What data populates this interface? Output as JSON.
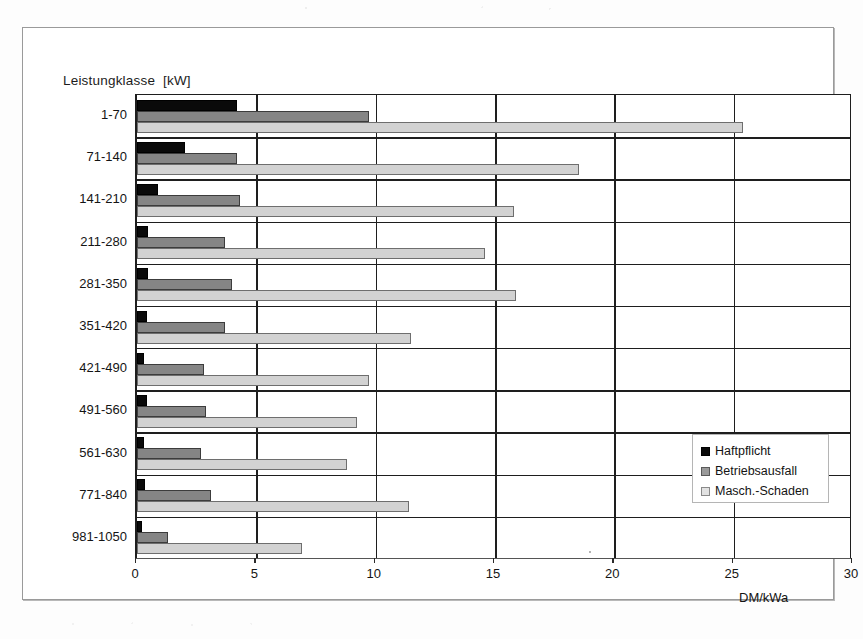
{
  "figure": {
    "axis_title_y": "Leistungklasse  [kW]",
    "axis_title_x": "DM/kWa"
  },
  "legend": {
    "items": [
      {
        "label": "Haftpflicht",
        "color": "#0a0a0a",
        "swatch": "legend-swatch-haftpflicht"
      },
      {
        "label": "Betriebsausfall",
        "color": "#858585",
        "swatch": "legend-swatch-betriebsausfall"
      },
      {
        "label": "Masch.-Schaden",
        "color": "#d2d2d2",
        "swatch": "legend-swatch-masch-schaden"
      }
    ]
  },
  "chart_data": {
    "type": "bar",
    "orientation": "horizontal",
    "title": "",
    "xlabel": "DM/kWa",
    "ylabel": "Leistungklasse  [kW]",
    "xlim": [
      0,
      30
    ],
    "xticks": [
      0,
      5,
      10,
      15,
      20,
      25,
      30
    ],
    "xtick_labels": [
      "0",
      "5",
      "10",
      "15",
      "20",
      "25",
      "30"
    ],
    "grid": "vertical-major",
    "legend_position": "center-right",
    "categories": [
      "1-70",
      "71-140",
      "141-210",
      "211-280",
      "281-350",
      "351-420",
      "421-490",
      "491-560",
      "561-630",
      "771-840",
      "981-1050"
    ],
    "series": [
      {
        "name": "Haftpflicht",
        "color": "#0a0a0a",
        "values": [
          4.2,
          2.0,
          0.9,
          0.45,
          0.45,
          0.4,
          0.3,
          0.4,
          0.3,
          0.35,
          0.2
        ]
      },
      {
        "name": "Betriebsausfall",
        "color": "#858585",
        "values": [
          9.7,
          4.2,
          4.3,
          3.7,
          4.0,
          3.7,
          2.8,
          2.9,
          2.7,
          3.1,
          1.3
        ]
      },
      {
        "name": "Masch.-Schaden",
        "color": "#d2d2d2",
        "values": [
          25.4,
          18.5,
          15.8,
          14.6,
          15.9,
          11.5,
          9.7,
          9.2,
          8.8,
          11.4,
          6.9
        ]
      }
    ]
  }
}
